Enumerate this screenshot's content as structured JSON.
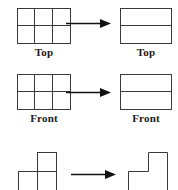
{
  "figure": {
    "stroke_color": "#3a3a3a",
    "text_color": "#1a1a1a",
    "background": "#ffffff",
    "arrow_color": "#111111"
  },
  "rows": [
    {
      "id": "top-row",
      "left_label": "Top",
      "right_label": "Top",
      "arrow_label": "becomes",
      "left_shape": {
        "type": "grid",
        "cols": 3,
        "rows": 2
      },
      "right_shape": {
        "type": "grid",
        "cols": 1,
        "rows": 2
      }
    },
    {
      "id": "front-row",
      "left_label": "Front",
      "right_label": "Front",
      "arrow_label": "becomes",
      "left_shape": {
        "type": "grid",
        "cols": 3,
        "rows": 2
      },
      "right_shape": {
        "type": "grid",
        "cols": 1,
        "rows": 2
      }
    },
    {
      "id": "side-row",
      "left_label": "",
      "right_label": "",
      "arrow_label": "becomes",
      "left_shape": {
        "type": "l-tromino",
        "cells": "top-right, bottom-left, bottom-right",
        "divided": true
      },
      "right_shape": {
        "type": "l-tromino",
        "cells": "top-right, bottom-left, bottom-right",
        "divided": false
      }
    }
  ],
  "icons": {
    "arrow": "right-arrow-icon"
  }
}
